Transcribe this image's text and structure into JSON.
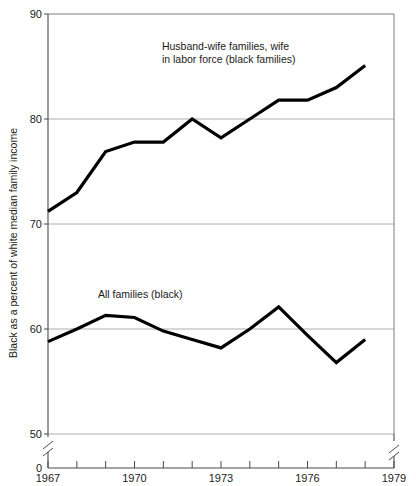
{
  "chart_data": {
    "type": "line",
    "title": "",
    "xlabel": "",
    "ylabel": "Black as a percent of white median family income",
    "x": [
      1967,
      1968,
      1969,
      1970,
      1971,
      1972,
      1973,
      1974,
      1975,
      1976,
      1977,
      1978
    ],
    "xlim": [
      1967,
      1979
    ],
    "ylim": [
      50,
      90
    ],
    "y_axis_break": true,
    "y_break_label": "0",
    "xticklabels": [
      "1967",
      "1970",
      "1973",
      "1976",
      "1979"
    ],
    "xtickvalues": [
      1967,
      1970,
      1973,
      1976,
      1979
    ],
    "yticklabels": [
      "50",
      "60",
      "70",
      "80",
      "90"
    ],
    "ytickvalues": [
      50,
      60,
      70,
      80,
      90
    ],
    "grid": true,
    "grid_axis": "y",
    "legend_position": "inline-annotation",
    "series": [
      {
        "name": "Husband-wife families, wife in labor force (black families)",
        "values": [
          71.2,
          73.0,
          76.9,
          77.8,
          77.8,
          80.0,
          78.2,
          80.0,
          81.8,
          81.8,
          83.0,
          85.1
        ]
      },
      {
        "name": "All families (black)",
        "values": [
          58.8,
          60.0,
          61.3,
          61.1,
          59.8,
          59.0,
          58.2,
          60.0,
          62.1,
          59.4,
          56.8,
          59.0
        ]
      }
    ],
    "annotations": [
      {
        "id": "annotation-husband-wife",
        "lines": [
          "Husband-wife families, wife",
          "in labor force (black families)"
        ],
        "x": 1973.1,
        "y": 86.6
      },
      {
        "id": "annotation-all-families",
        "lines": [
          "All families (black)"
        ],
        "x": 1970.2,
        "y": 63.0
      }
    ],
    "colors": {
      "series_line": "#000000",
      "gridline": "#9a9a9a",
      "frame": "#7d7d7d",
      "axis": "#4a4a4a",
      "text": "#1b1b1b",
      "background": "#ffffff"
    }
  }
}
